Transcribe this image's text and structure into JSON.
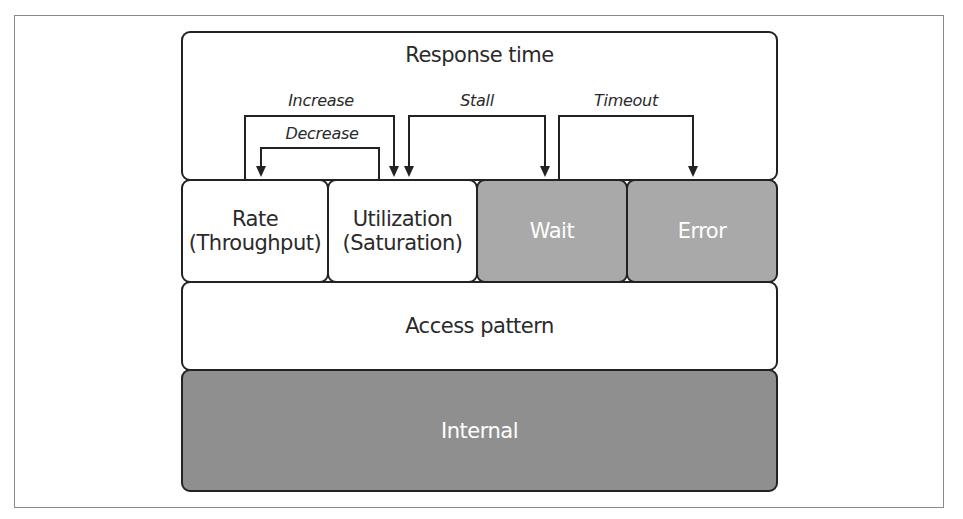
{
  "diagram": {
    "top": {
      "label": "Response time"
    },
    "middle_row": [
      {
        "line1": "Rate",
        "line2": "(Throughput)",
        "fill": "#ffffff"
      },
      {
        "line1": "Utilization",
        "line2": "(Saturation)",
        "fill": "#ffffff"
      },
      {
        "line1": "Wait",
        "line2": "",
        "fill": "#a9a9a9"
      },
      {
        "line1": "Error",
        "line2": "",
        "fill": "#a9a9a9"
      }
    ],
    "access": {
      "label": "Access pattern"
    },
    "internal": {
      "label": "Internal"
    },
    "arrows": [
      {
        "label": "Increase",
        "from": "Rate",
        "to": "Utilization"
      },
      {
        "label": "Decrease",
        "from": "Utilization",
        "to": "Rate"
      },
      {
        "label": "Stall",
        "from": "Utilization / Wait",
        "to": "Utilization and Wait"
      },
      {
        "label": "Timeout",
        "from": "Wait",
        "to": "Error"
      }
    ]
  }
}
